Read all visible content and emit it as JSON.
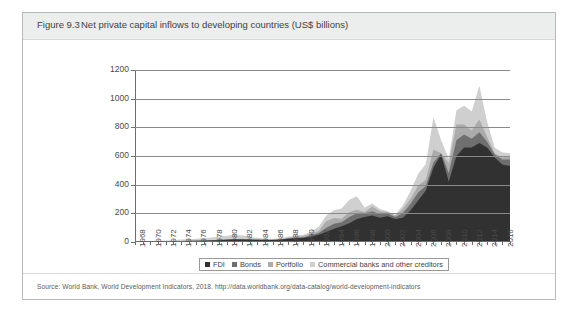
{
  "figure": {
    "label": "Figure 9.3",
    "title": "Net private capital inflows to developing countries (US$ billions)",
    "source": "Source: World Bank, World Development Indicators, 2018. http://data.worldbank.org/data-catalog/world-development-indicators"
  },
  "chart_data": {
    "type": "area",
    "stacked": true,
    "title": "Net private capital inflows to developing countries (US$ billions)",
    "xlabel": "",
    "ylabel": "",
    "ylim": [
      0,
      1200
    ],
    "yticks": [
      0,
      200,
      400,
      600,
      800,
      1000,
      1200
    ],
    "grid": true,
    "legend_position": "bottom",
    "x": [
      1968,
      1969,
      1970,
      1971,
      1972,
      1973,
      1974,
      1975,
      1976,
      1977,
      1978,
      1979,
      1980,
      1981,
      1982,
      1983,
      1984,
      1985,
      1986,
      1987,
      1988,
      1989,
      1990,
      1991,
      1992,
      1993,
      1994,
      1995,
      1996,
      1997,
      1998,
      1999,
      2000,
      2001,
      2002,
      2003,
      2004,
      2005,
      2006,
      2007,
      2008,
      2009,
      2010,
      2011,
      2012,
      2013,
      2014,
      2015,
      2016,
      2017
    ],
    "xtick_labels": [
      "1968",
      "1970",
      "1972",
      "1974",
      "1976",
      "1978",
      "1980",
      "1982",
      "1984",
      "1986",
      "1988",
      "1990",
      "1992",
      "1994",
      "1996",
      "1998",
      "2000",
      "2002",
      "2004",
      "2006",
      "2008",
      "2010",
      "2012",
      "2014",
      "2016"
    ],
    "series": [
      {
        "name": "FDI",
        "color": "#313131",
        "values": [
          2,
          2,
          3,
          3,
          4,
          5,
          6,
          7,
          8,
          9,
          11,
          13,
          15,
          17,
          18,
          16,
          15,
          14,
          14,
          16,
          22,
          26,
          28,
          37,
          51,
          70,
          92,
          110,
          130,
          160,
          175,
          185,
          170,
          180,
          160,
          170,
          220,
          290,
          360,
          520,
          610,
          420,
          600,
          660,
          660,
          690,
          660,
          590,
          540,
          530
        ]
      },
      {
        "name": "Bonds",
        "color": "#6f6f6f",
        "values": [
          0,
          0,
          0,
          0,
          0,
          0,
          1,
          1,
          1,
          1,
          2,
          2,
          2,
          2,
          2,
          1,
          1,
          1,
          1,
          2,
          3,
          4,
          5,
          8,
          12,
          30,
          35,
          28,
          45,
          40,
          25,
          28,
          25,
          20,
          15,
          30,
          45,
          55,
          30,
          35,
          10,
          60,
          110,
          90,
          60,
          75,
          40,
          20,
          35,
          45
        ]
      },
      {
        "name": "Portfolio",
        "color": "#ababab",
        "values": [
          0,
          0,
          0,
          0,
          0,
          0,
          0,
          0,
          0,
          0,
          0,
          0,
          1,
          1,
          1,
          1,
          1,
          1,
          1,
          2,
          4,
          6,
          8,
          12,
          14,
          45,
          40,
          25,
          35,
          25,
          10,
          35,
          20,
          10,
          10,
          30,
          35,
          50,
          45,
          90,
          -40,
          70,
          110,
          70,
          60,
          90,
          35,
          10,
          15,
          25
        ]
      },
      {
        "name": "Commercial banks and other creditors",
        "color": "#cfcfcf",
        "values": [
          3,
          3,
          4,
          5,
          6,
          8,
          10,
          12,
          14,
          16,
          19,
          22,
          25,
          28,
          26,
          18,
          12,
          8,
          6,
          6,
          8,
          9,
          10,
          16,
          30,
          40,
          55,
          70,
          85,
          95,
          30,
          20,
          15,
          5,
          5,
          25,
          55,
          80,
          110,
          225,
          90,
          30,
          100,
          130,
          130,
          235,
          105,
          40,
          35,
          20
        ]
      }
    ]
  },
  "legend": {
    "items": [
      {
        "label": "FDI",
        "color": "#313131"
      },
      {
        "label": "Bonds",
        "color": "#6f6f6f"
      },
      {
        "label": "Portfolio",
        "color": "#ababab"
      },
      {
        "label": "Commercial banks and other creditors",
        "color": "#cfcfcf"
      }
    ]
  }
}
